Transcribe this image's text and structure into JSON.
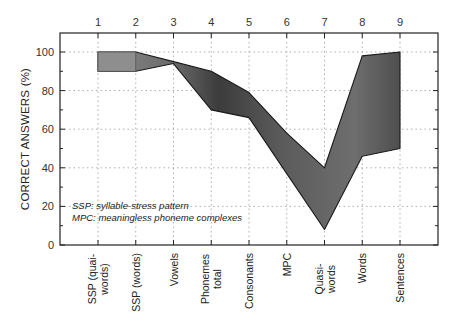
{
  "chart_data": {
    "type": "area",
    "title": "",
    "xlabel": "",
    "ylabel": "CORRECT ANSWERS (%)",
    "ylim": [
      0,
      110
    ],
    "yticks": [
      0,
      20,
      40,
      60,
      80,
      100
    ],
    "grid": true,
    "top_axis_ticks": [
      "1",
      "2",
      "3",
      "4",
      "5",
      "6",
      "7",
      "8",
      "9"
    ],
    "categories": [
      "SSP (quai-words)",
      "SSP (words)",
      "Vowels",
      "Phonemes total",
      "Consonants",
      "MPC",
      "Quasi-words",
      "Words",
      "Sentences"
    ],
    "category_lines": [
      [
        "SSP (quai-",
        "words)"
      ],
      [
        "SSP (words)"
      ],
      [
        "Vowels"
      ],
      [
        "Phonemes",
        "total"
      ],
      [
        "Consonants"
      ],
      [
        "MPC"
      ],
      [
        "Quasi-",
        "words"
      ],
      [
        "Words"
      ],
      [
        "Sentences"
      ]
    ],
    "series": [
      {
        "name": "upper",
        "values": [
          100,
          100,
          95,
          90,
          79,
          58,
          40,
          98,
          100
        ]
      },
      {
        "name": "lower",
        "values": [
          90,
          90,
          94,
          70,
          66,
          37,
          8,
          46,
          50
        ]
      }
    ],
    "annotations": [
      "SSP: syllable-stress pattern",
      "MPC: meaningless phoneme complexes"
    ],
    "colors": {
      "band": "#4a4a4a",
      "band_light": "#8a8a8a",
      "grid": "#9a9a9a",
      "axis": "#222222"
    }
  }
}
